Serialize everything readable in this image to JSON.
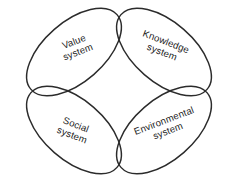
{
  "diagram": {
    "shape_kind": "four-petal venn",
    "background_color": "#ffffff",
    "stroke_color": "#2b2b2b",
    "text_color": "#1c1c1c",
    "center": {
      "x": 119,
      "y": 91
    },
    "petals": [
      {
        "id": "value-system",
        "line1": "Value",
        "line2": "system",
        "position": "top-left",
        "rotation_deg": -21,
        "ellipse": {
          "cx": 74,
          "cy": 52,
          "rx": 57,
          "ry": 30,
          "rotate_deg": -41
        },
        "label": {
          "x": 76,
          "y": 47
        }
      },
      {
        "id": "knowledge-system",
        "line1": "Knowledge",
        "line2": "system",
        "position": "top-right",
        "rotation_deg": 21,
        "ellipse": {
          "cx": 164,
          "cy": 52,
          "rx": 57,
          "ry": 30,
          "rotate_deg": 41
        },
        "label": {
          "x": 164,
          "y": 47
        }
      },
      {
        "id": "social-system",
        "line1": "Social",
        "line2": "system",
        "position": "bottom-left",
        "rotation_deg": 21,
        "ellipse": {
          "cx": 74,
          "cy": 130,
          "rx": 57,
          "ry": 30,
          "rotate_deg": 41
        },
        "label": {
          "x": 74,
          "y": 130
        }
      },
      {
        "id": "environmental-system",
        "line1": "Environmental",
        "line2": "system",
        "position": "bottom-right",
        "rotation_deg": -21,
        "ellipse": {
          "cx": 164,
          "cy": 130,
          "rx": 57,
          "ry": 30,
          "rotate_deg": -41
        },
        "label": {
          "x": 166,
          "y": 126
        }
      }
    ]
  }
}
